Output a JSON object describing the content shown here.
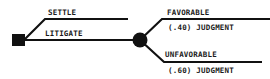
{
  "diagram": {
    "type": "decision-tree",
    "colors": {
      "ink": "#111111",
      "background": "#ffffff"
    },
    "decision_node": {
      "shape": "square",
      "label": ""
    },
    "decision_branches": [
      {
        "label": "SETTLE"
      },
      {
        "label": "LITIGATE"
      }
    ],
    "chance_node": {
      "shape": "circle",
      "label": ""
    },
    "chance_branches": [
      {
        "label": "FAVORABLE",
        "probability": "(.40)",
        "sublabel": "JUDGMENT",
        "sublabel_full": "(.40) JUDGMENT"
      },
      {
        "label": "UNFAVORABLE",
        "probability": "(.60)",
        "sublabel": "JUDGMENT",
        "sublabel_full": "(.60) JUDGMENT"
      }
    ]
  }
}
